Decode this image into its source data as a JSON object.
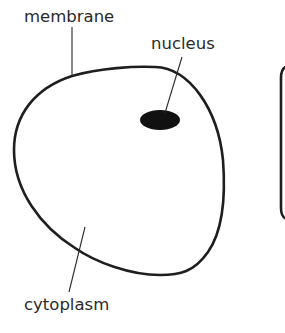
{
  "diagram": {
    "labels": {
      "membrane": "membrane",
      "nucleus": "nucleus",
      "cytoplasm": "cytoplasm"
    },
    "colors": {
      "outline": "#1e1e1e",
      "nucleus_fill": "#111111",
      "text": "#2a2a2a",
      "background": "#ffffff"
    },
    "parts": [
      {
        "name": "membrane",
        "type": "outline"
      },
      {
        "name": "nucleus",
        "type": "filled-ellipse"
      },
      {
        "name": "cytoplasm",
        "type": "interior-region"
      }
    ]
  }
}
